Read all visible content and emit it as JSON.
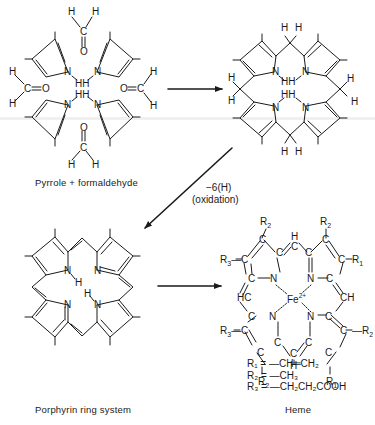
{
  "panels": {
    "pyrrole_formaldehyde": {
      "caption": "Pyrrole + formaldehyde",
      "atoms": {
        "N": "N",
        "H": "H",
        "HH": "HH",
        "C": "C",
        "O": "O"
      }
    },
    "porphyrinogen": {
      "atoms": {
        "N": "N",
        "H": "H",
        "HH": "HH"
      }
    },
    "porphyrin": {
      "caption": "Porphyrin ring system",
      "atoms": {
        "N": "N",
        "H": "H"
      }
    },
    "heme": {
      "caption": "Heme",
      "metal": "Fe",
      "metal_charge": "2+",
      "substituents": [
        {
          "label": "R",
          "sub": "1",
          "formula": "=—CH═CH₂"
        },
        {
          "label": "R",
          "sub": "2",
          "formula": "=—CH₃"
        },
        {
          "label": "R",
          "sub": "3",
          "formula": "=—CH₂CH₂COOH"
        }
      ],
      "legend_lines": [
        "R₁ = —CH═CH₂",
        "R₂ = —CH₃",
        "R₃ = —CH₂CH₂COOH"
      ]
    }
  },
  "arrows": {
    "step1": {
      "direction": "right"
    },
    "step2": {
      "direction": "down-left",
      "label_line1": "−6(H)",
      "label_line2": "(oxidation)"
    },
    "step3": {
      "direction": "right"
    }
  }
}
